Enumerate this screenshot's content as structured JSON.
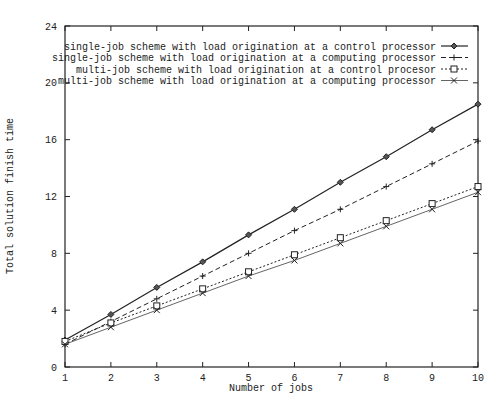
{
  "chart_data": {
    "type": "line",
    "title": "",
    "xlabel": "Number of jobs",
    "ylabel": "Total solution finish time",
    "xlim": [
      1,
      10
    ],
    "ylim": [
      0,
      24
    ],
    "xticks": [
      1,
      2,
      3,
      4,
      5,
      6,
      7,
      8,
      9,
      10
    ],
    "yticks": [
      0,
      4,
      8,
      12,
      16,
      20,
      24
    ],
    "grid": false,
    "legend_position": "top-right-inside",
    "x": [
      1,
      2,
      3,
      4,
      5,
      6,
      7,
      8,
      9,
      10
    ],
    "series": [
      {
        "name": "single-job scheme with load origination at a control processor",
        "marker": "diamond",
        "line": "solid",
        "values": [
          1.9,
          3.7,
          5.6,
          7.4,
          9.3,
          11.1,
          13.0,
          14.8,
          16.7,
          18.5
        ]
      },
      {
        "name": "single-job scheme with load origination at a computing processor",
        "marker": "plus",
        "line": "dashed",
        "values": [
          1.6,
          3.2,
          4.8,
          6.4,
          8.0,
          9.6,
          11.1,
          12.7,
          14.3,
          15.9
        ]
      },
      {
        "name": "multi-job scheme with load origination at a control procesor",
        "marker": "square",
        "line": "dotted",
        "values": [
          1.8,
          3.1,
          4.3,
          5.5,
          6.7,
          7.9,
          9.1,
          10.3,
          11.5,
          12.7
        ]
      },
      {
        "name": "multi-job scheme with load origination at a computing processor",
        "marker": "cross",
        "line": "thin-solid",
        "values": [
          1.6,
          2.8,
          4.0,
          5.2,
          6.4,
          7.5,
          8.7,
          9.9,
          11.1,
          12.3
        ]
      }
    ]
  },
  "colors": {
    "line": "#222222",
    "background": "#ffffff"
  }
}
